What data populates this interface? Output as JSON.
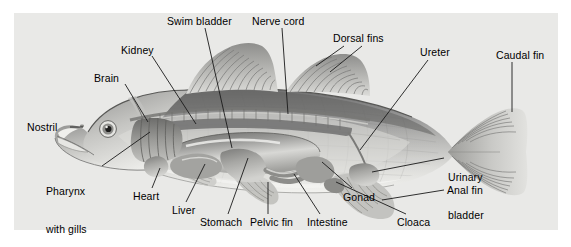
{
  "figure": {
    "style": "grayscale airbrushed illustration on light grey panel",
    "panel_bg": "#e9e9e7",
    "page_bg": "#ffffff",
    "label_color": "#000000",
    "leader_color": "#1a1a1a"
  },
  "labels": [
    {
      "id": "swim-bladder",
      "text": "Swim bladder",
      "lines": [
        "Swim bladder"
      ],
      "x": 167,
      "y": 15,
      "align": "left"
    },
    {
      "id": "nerve-cord",
      "text": "Nerve cord",
      "lines": [
        "Nerve cord"
      ],
      "x": 252,
      "y": 15,
      "align": "left"
    },
    {
      "id": "dorsal-fins",
      "text": "Dorsal fins",
      "lines": [
        "Dorsal fins"
      ],
      "x": 333,
      "y": 32,
      "align": "left"
    },
    {
      "id": "ureter",
      "text": "Ureter",
      "lines": [
        "Ureter"
      ],
      "x": 420,
      "y": 46,
      "align": "left"
    },
    {
      "id": "caudal-fin",
      "text": "Caudal fin",
      "lines": [
        "Caudal fin"
      ],
      "x": 496,
      "y": 49,
      "align": "left"
    },
    {
      "id": "kidney",
      "text": "Kidney",
      "lines": [
        "Kidney"
      ],
      "x": 121,
      "y": 44,
      "align": "left"
    },
    {
      "id": "brain",
      "text": "Brain",
      "lines": [
        "Brain"
      ],
      "x": 94,
      "y": 72,
      "align": "left"
    },
    {
      "id": "nostril",
      "text": "Nostril",
      "lines": [
        "Nostril"
      ],
      "x": 27,
      "y": 121,
      "align": "left"
    },
    {
      "id": "pharynx-gills",
      "text": "Pharynx with gills",
      "lines": [
        "Pharynx",
        "with gills"
      ],
      "x": 46,
      "y": 160,
      "align": "left"
    },
    {
      "id": "heart",
      "text": "Heart",
      "lines": [
        "Heart"
      ],
      "x": 133,
      "y": 190,
      "align": "left"
    },
    {
      "id": "liver",
      "text": "Liver",
      "lines": [
        "Liver"
      ],
      "x": 172,
      "y": 204,
      "align": "left"
    },
    {
      "id": "stomach",
      "text": "Stomach",
      "lines": [
        "Stomach"
      ],
      "x": 200,
      "y": 216,
      "align": "left"
    },
    {
      "id": "pelvic-fin",
      "text": "Pelvic fin",
      "lines": [
        "Pelvic fin"
      ],
      "x": 250,
      "y": 216,
      "align": "left"
    },
    {
      "id": "intestine",
      "text": "Intestine",
      "lines": [
        "Intestine"
      ],
      "x": 307,
      "y": 216,
      "align": "left"
    },
    {
      "id": "gonad",
      "text": "Gonad",
      "lines": [
        "Gonad"
      ],
      "x": 343,
      "y": 191,
      "align": "left"
    },
    {
      "id": "cloaca",
      "text": "Cloaca",
      "lines": [
        "Cloaca"
      ],
      "x": 397,
      "y": 216,
      "align": "left"
    },
    {
      "id": "anal-fin",
      "text": "Anal fin",
      "lines": [
        "Anal fin"
      ],
      "x": 447,
      "y": 184,
      "align": "left"
    },
    {
      "id": "urinary-bladder",
      "text": "Urinary bladder",
      "lines": [
        "Urinary",
        "bladder"
      ],
      "x": 448,
      "y": 146,
      "align": "left"
    }
  ],
  "anatomy_parts": [
    "Swim bladder",
    "Nerve cord",
    "Dorsal fins",
    "Ureter",
    "Caudal fin",
    "Kidney",
    "Brain",
    "Nostril",
    "Pharynx with gills",
    "Heart",
    "Liver",
    "Stomach",
    "Pelvic fin",
    "Intestine",
    "Gonad",
    "Cloaca",
    "Anal fin",
    "Urinary bladder"
  ]
}
